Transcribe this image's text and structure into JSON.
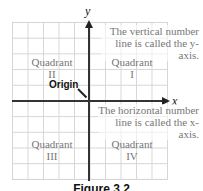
{
  "diagram": {
    "axes": {
      "x_label": "x",
      "y_label": "y"
    },
    "annotations": {
      "vertical_note_line1": "The vertical number",
      "vertical_note_line2": "line is called the y-axis.",
      "horizontal_note_line1": "The horizontal number",
      "horizontal_note_line2": "line is called the x-axis.",
      "origin": "Origin"
    },
    "quadrants": [
      {
        "word": "Quadrant",
        "numeral": "I"
      },
      {
        "word": "Quadrant",
        "numeral": "II"
      },
      {
        "word": "Quadrant",
        "numeral": "III"
      },
      {
        "word": "Quadrant",
        "numeral": "IV"
      }
    ],
    "caption": "Figure 3.2",
    "colors": {
      "axis": "#333333",
      "grid": "#d6d6d6",
      "text_muted": "#777777"
    }
  }
}
